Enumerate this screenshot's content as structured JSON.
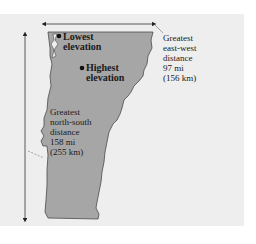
{
  "map": {
    "region": "Vermont",
    "colors": {
      "background": "#eeeeee",
      "state_fill": "#a6a6a6",
      "state_outline": "#4a4a4a",
      "text": "#1a1a1a"
    },
    "markers": [
      {
        "name": "lowest-elevation",
        "lines": [
          "Lowest",
          "elevation"
        ]
      },
      {
        "name": "highest-elevation",
        "lines": [
          "Highest",
          "elevation"
        ]
      }
    ],
    "measurements": {
      "east_west": {
        "lines": [
          "Greatest",
          "east-west",
          "distance",
          "97 mi",
          "(156 km)"
        ]
      },
      "north_south": {
        "lines": [
          "Greatest",
          "north-south",
          "distance",
          "158 mi",
          "(255 km)"
        ]
      }
    }
  }
}
